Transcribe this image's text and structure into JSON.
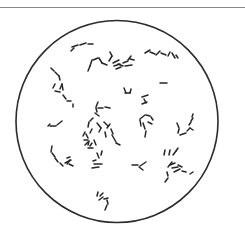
{
  "figure": {
    "kind": "microscope-field-illustration",
    "width": 245,
    "height": 227,
    "background": "#ffffff",
    "top_rule": {
      "y": 7.5,
      "color": "#8a8a8a"
    },
    "field_circle": {
      "cx": 117,
      "cy": 121.5,
      "r": 101,
      "stroke": "#2b2b2b",
      "stroke_width": 1.6
    },
    "rod_color": "#262626",
    "rod_width": 1.5,
    "rods": [
      [
        72,
        47,
        78,
        45
      ],
      [
        80,
        45,
        86,
        43
      ],
      [
        88,
        44,
        93,
        44
      ],
      [
        74,
        48,
        71,
        51
      ],
      [
        93,
        60,
        98,
        58
      ],
      [
        92,
        60,
        90,
        66
      ],
      [
        90,
        66,
        88,
        71
      ],
      [
        99,
        58,
        102,
        63
      ],
      [
        102,
        63,
        107,
        65
      ],
      [
        109,
        61,
        112,
        56
      ],
      [
        112,
        56,
        110,
        52
      ],
      [
        113,
        63,
        119,
        60
      ],
      [
        114,
        66,
        120,
        64
      ],
      [
        116,
        69,
        121,
        67
      ],
      [
        118,
        64,
        123,
        66
      ],
      [
        123,
        63,
        128,
        61
      ],
      [
        125,
        66,
        132,
        65
      ],
      [
        128,
        60,
        131,
        56
      ],
      [
        130,
        59,
        134,
        60
      ],
      [
        145,
        53,
        150,
        50
      ],
      [
        150,
        52,
        155,
        54
      ],
      [
        156,
        55,
        160,
        51
      ],
      [
        161,
        53,
        166,
        55
      ],
      [
        168,
        56,
        170,
        52
      ],
      [
        172,
        53,
        175,
        58
      ],
      [
        176,
        55,
        178,
        58
      ],
      [
        160,
        83,
        167,
        83
      ],
      [
        51,
        68,
        54,
        71
      ],
      [
        55,
        72,
        59,
        76
      ],
      [
        59,
        76,
        60,
        80
      ],
      [
        53,
        88,
        55,
        84
      ],
      [
        55,
        91,
        60,
        92
      ],
      [
        60,
        89,
        62,
        84
      ],
      [
        62,
        84,
        63,
        90
      ],
      [
        63,
        95,
        66,
        99
      ],
      [
        67,
        101,
        71,
        101
      ],
      [
        73,
        104,
        73,
        107
      ],
      [
        124,
        88,
        126,
        93
      ],
      [
        125,
        93,
        130,
        93
      ],
      [
        130,
        93,
        131,
        89
      ],
      [
        142,
        97,
        148,
        95
      ],
      [
        144,
        99,
        146,
        103
      ],
      [
        142,
        104,
        147,
        102
      ],
      [
        98,
        102,
        96,
        107
      ],
      [
        96,
        108,
        97,
        112
      ],
      [
        98,
        108,
        103,
        108
      ],
      [
        105,
        107,
        110,
        108
      ],
      [
        95,
        113,
        99,
        116
      ],
      [
        48,
        126,
        50,
        124
      ],
      [
        50,
        126,
        56,
        126
      ],
      [
        57,
        125,
        62,
        121
      ],
      [
        93,
        118,
        90,
        121
      ],
      [
        89,
        122,
        88,
        127
      ],
      [
        92,
        129,
        90,
        133
      ],
      [
        97,
        123,
        101,
        128
      ],
      [
        101,
        128,
        99,
        132
      ],
      [
        104,
        122,
        108,
        126
      ],
      [
        107,
        128,
        110,
        124
      ],
      [
        111,
        129,
        113,
        134
      ],
      [
        105,
        132,
        106,
        137
      ],
      [
        86,
        134,
        88,
        138
      ],
      [
        84,
        140,
        88,
        140
      ],
      [
        85,
        145,
        88,
        142
      ],
      [
        88,
        145,
        89,
        141
      ],
      [
        90,
        146,
        92,
        143
      ],
      [
        94,
        140,
        96,
        145
      ],
      [
        88,
        148,
        93,
        148
      ],
      [
        83,
        136,
        85,
        132
      ],
      [
        112,
        135,
        116,
        142
      ],
      [
        116,
        143,
        120,
        145
      ],
      [
        141,
        126,
        140,
        120
      ],
      [
        140,
        119,
        145,
        115
      ],
      [
        146,
        115,
        150,
        116
      ],
      [
        151,
        117,
        153,
        120
      ],
      [
        143,
        123,
        145,
        129
      ],
      [
        146,
        131,
        145,
        137
      ],
      [
        148,
        122,
        152,
        124
      ],
      [
        177,
        123,
        179,
        128
      ],
      [
        179,
        129,
        178,
        133
      ],
      [
        180,
        135,
        186,
        133
      ],
      [
        187,
        131,
        190,
        128
      ],
      [
        189,
        125,
        191,
        122
      ],
      [
        191,
        121,
        193,
        118
      ],
      [
        192,
        117,
        193,
        114
      ],
      [
        190,
        128,
        193,
        130
      ],
      [
        52,
        146,
        51,
        152
      ],
      [
        52,
        153,
        55,
        157
      ],
      [
        55,
        158,
        58,
        162
      ],
      [
        60,
        163,
        63,
        166
      ],
      [
        65,
        163,
        71,
        160
      ],
      [
        70,
        160,
        67,
        164
      ],
      [
        69,
        164,
        73,
        166
      ],
      [
        67,
        158,
        70,
        157
      ],
      [
        97,
        153,
        99,
        158
      ],
      [
        101,
        155,
        102,
        151
      ],
      [
        94,
        164,
        102,
        164
      ],
      [
        92,
        168,
        99,
        167
      ],
      [
        93,
        161,
        96,
        160
      ],
      [
        132,
        165,
        138,
        165
      ],
      [
        139,
        167,
        143,
        170
      ],
      [
        140,
        166,
        146,
        162
      ],
      [
        165,
        150,
        164,
        155
      ],
      [
        170,
        150,
        169,
        155
      ],
      [
        173,
        155,
        176,
        151
      ],
      [
        176,
        151,
        178,
        148
      ],
      [
        168,
        167,
        172,
        162
      ],
      [
        167,
        172,
        168,
        176
      ],
      [
        170,
        165,
        175,
        163
      ],
      [
        172,
        168,
        178,
        167
      ],
      [
        174,
        172,
        180,
        169
      ],
      [
        178,
        165,
        182,
        167
      ],
      [
        182,
        171,
        186,
        172
      ],
      [
        190,
        174,
        193,
        172
      ],
      [
        168,
        178,
        165,
        182
      ],
      [
        100,
        196,
        103,
        193
      ],
      [
        99,
        200,
        103,
        197
      ],
      [
        104,
        199,
        108,
        198
      ],
      [
        107,
        200,
        108,
        204
      ],
      [
        107,
        205,
        105,
        210
      ],
      [
        98,
        192,
        97,
        196
      ]
    ]
  }
}
